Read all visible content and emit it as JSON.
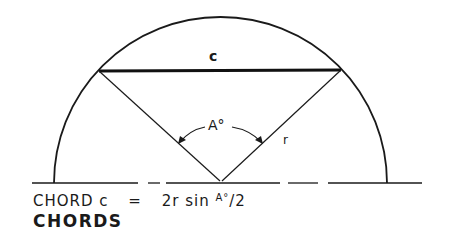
{
  "diagram": {
    "title": "CHORDS",
    "formula": {
      "lhs": "CHORD c",
      "equals": "=",
      "rhs_main": "2r sin",
      "rhs_superscript": "A°",
      "rhs_tail": "/2"
    },
    "labels": {
      "chord": "c",
      "angle": "A°",
      "radius": "r"
    },
    "geometry": {
      "center": [
        220.5,
        183
      ],
      "radius": 166.5,
      "chord_endpoints": [
        [
          99,
          71
        ],
        [
          341,
          70
        ]
      ],
      "baseline": {
        "y": 183,
        "x_start": 32,
        "x_end": 422,
        "style": "dashed"
      }
    },
    "colors": {
      "stroke": "#1a1a1a",
      "background": "#ffffff"
    }
  }
}
